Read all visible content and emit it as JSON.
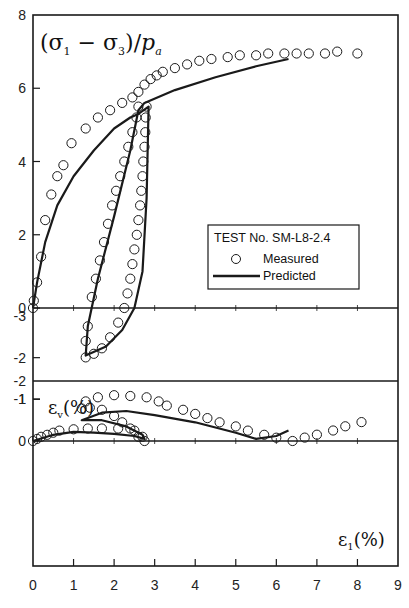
{
  "chart_data": [
    {
      "panel": "upper",
      "type": "scatter",
      "title": "",
      "ylabel": "(σ1 − σ3)/pa",
      "xlabel": "ε1(%)",
      "xlim": [
        0,
        9
      ],
      "ylim": [
        -2,
        8
      ],
      "x_ticks": [
        "0",
        "1",
        "2",
        "3",
        "4",
        "5",
        "6",
        "7",
        "8",
        "9"
      ],
      "y_ticks": [
        "8",
        "6",
        "4",
        "2",
        "0",
        "-2"
      ],
      "grid": false,
      "legend": {
        "position": "inside-center-right",
        "title": "TEST No. SM-L8-2.4",
        "entries": [
          {
            "label": "Measured",
            "marker": "open-circle"
          },
          {
            "label": "Predicted",
            "marker": "solid-line"
          }
        ]
      },
      "series": [
        {
          "name": "Measured",
          "style": "open-circle",
          "points": [
            [
              0.0,
              0.0
            ],
            [
              0.02,
              0.2
            ],
            [
              0.1,
              0.7
            ],
            [
              0.2,
              1.4
            ],
            [
              0.3,
              2.4
            ],
            [
              0.45,
              3.1
            ],
            [
              0.6,
              3.6
            ],
            [
              0.75,
              3.9
            ],
            [
              0.95,
              4.5
            ],
            [
              1.3,
              4.9
            ],
            [
              1.6,
              5.2
            ],
            [
              1.9,
              5.4
            ],
            [
              2.2,
              5.6
            ],
            [
              2.45,
              5.75
            ],
            [
              2.6,
              5.9
            ],
            [
              2.75,
              6.1
            ],
            [
              2.9,
              6.25
            ],
            [
              3.05,
              6.35
            ],
            [
              3.2,
              6.45
            ],
            [
              3.5,
              6.55
            ],
            [
              3.8,
              6.65
            ],
            [
              4.1,
              6.75
            ],
            [
              4.4,
              6.8
            ],
            [
              4.8,
              6.85
            ],
            [
              5.1,
              6.9
            ],
            [
              5.5,
              6.9
            ],
            [
              5.8,
              6.95
            ],
            [
              6.2,
              6.95
            ],
            [
              6.5,
              6.95
            ],
            [
              6.8,
              6.95
            ],
            [
              7.2,
              6.95
            ],
            [
              7.5,
              7.0
            ],
            [
              8.0,
              6.95
            ],
            [
              2.8,
              5.5
            ],
            [
              2.78,
              5.2
            ],
            [
              2.77,
              4.8
            ],
            [
              2.75,
              4.4
            ],
            [
              2.72,
              4.0
            ],
            [
              2.7,
              3.6
            ],
            [
              2.67,
              3.2
            ],
            [
              2.64,
              2.8
            ],
            [
              2.6,
              2.4
            ],
            [
              2.56,
              2.0
            ],
            [
              2.5,
              1.6
            ],
            [
              2.45,
              1.2
            ],
            [
              2.4,
              0.8
            ],
            [
              2.33,
              0.4
            ],
            [
              2.25,
              0.0
            ],
            [
              2.1,
              -0.4
            ],
            [
              1.9,
              -0.8
            ],
            [
              1.7,
              -1.1
            ],
            [
              1.5,
              -1.25
            ],
            [
              1.3,
              -1.35
            ],
            [
              1.3,
              -0.9
            ],
            [
              1.35,
              -0.5
            ],
            [
              1.45,
              0.3
            ],
            [
              1.55,
              0.8
            ],
            [
              1.65,
              1.3
            ],
            [
              1.75,
              1.8
            ],
            [
              1.85,
              2.3
            ],
            [
              1.95,
              2.8
            ],
            [
              2.05,
              3.2
            ],
            [
              2.15,
              3.6
            ],
            [
              2.25,
              4.0
            ],
            [
              2.35,
              4.4
            ],
            [
              2.45,
              4.8
            ],
            [
              2.55,
              5.2
            ],
            [
              2.6,
              5.5
            ]
          ]
        },
        {
          "name": "Predicted",
          "style": "solid-line",
          "points": [
            [
              0.0,
              0.0
            ],
            [
              0.1,
              0.7
            ],
            [
              0.3,
              1.8
            ],
            [
              0.6,
              2.8
            ],
            [
              1.0,
              3.6
            ],
            [
              1.5,
              4.3
            ],
            [
              2.0,
              4.9
            ],
            [
              2.4,
              5.2
            ],
            [
              2.6,
              5.3
            ],
            [
              2.85,
              5.5
            ],
            [
              2.85,
              5.5
            ],
            [
              2.8,
              3.0
            ],
            [
              2.7,
              1.0
            ],
            [
              2.5,
              0.0
            ],
            [
              2.2,
              -0.6
            ],
            [
              1.8,
              -1.05
            ],
            [
              1.3,
              -1.3
            ],
            [
              1.35,
              -0.5
            ],
            [
              1.6,
              0.8
            ],
            [
              2.0,
              2.5
            ],
            [
              2.4,
              4.3
            ],
            [
              2.6,
              5.4
            ],
            [
              2.75,
              5.6
            ],
            [
              3.5,
              5.95
            ],
            [
              4.5,
              6.3
            ],
            [
              5.5,
              6.6
            ],
            [
              6.3,
              6.8
            ]
          ]
        }
      ]
    },
    {
      "panel": "lower",
      "type": "scatter",
      "title": "",
      "ylabel": "εv(%)",
      "xlabel": "ε1(%)",
      "xlim": [
        0,
        9
      ],
      "ylim": [
        -3,
        1
      ],
      "x_ticks": [
        "0",
        "1",
        "2",
        "3",
        "4",
        "5",
        "6",
        "7",
        "8",
        "9"
      ],
      "y_ticks": [
        "1",
        "0",
        "-1",
        "-2",
        "-3"
      ],
      "grid": false,
      "series": [
        {
          "name": "Measured",
          "style": "open-circle",
          "points": [
            [
              0.0,
              0.0
            ],
            [
              0.1,
              -0.05
            ],
            [
              0.2,
              -0.1
            ],
            [
              0.35,
              -0.15
            ],
            [
              0.5,
              -0.2
            ],
            [
              0.65,
              -0.25
            ],
            [
              1.0,
              -0.28
            ],
            [
              1.35,
              -0.3
            ],
            [
              1.7,
              -0.3
            ],
            [
              2.1,
              -0.3
            ],
            [
              2.5,
              -0.25
            ],
            [
              2.7,
              -0.1
            ],
            [
              2.75,
              0.0
            ],
            [
              2.6,
              -0.1
            ],
            [
              2.4,
              -0.3
            ],
            [
              2.2,
              -0.45
            ],
            [
              2.0,
              -0.6
            ],
            [
              1.7,
              -0.75
            ],
            [
              1.4,
              -0.8
            ],
            [
              1.2,
              -0.78
            ],
            [
              1.3,
              -0.95
            ],
            [
              1.6,
              -1.05
            ],
            [
              2.0,
              -1.1
            ],
            [
              2.4,
              -1.08
            ],
            [
              2.8,
              -1.05
            ],
            [
              3.1,
              -0.95
            ],
            [
              3.3,
              -0.85
            ],
            [
              3.7,
              -0.75
            ],
            [
              4.0,
              -0.65
            ],
            [
              4.3,
              -0.55
            ],
            [
              4.6,
              -0.45
            ],
            [
              5.0,
              -0.35
            ],
            [
              5.3,
              -0.25
            ],
            [
              5.7,
              -0.15
            ],
            [
              6.0,
              -0.08
            ],
            [
              6.4,
              0.0
            ],
            [
              6.7,
              0.08
            ],
            [
              7.0,
              0.15
            ],
            [
              7.4,
              0.25
            ],
            [
              7.7,
              0.35
            ],
            [
              8.1,
              0.45
            ]
          ]
        },
        {
          "name": "Predicted",
          "style": "solid-line",
          "points": [
            [
              0.0,
              0.0
            ],
            [
              0.5,
              -0.15
            ],
            [
              1.0,
              -0.22
            ],
            [
              1.5,
              -0.2
            ],
            [
              2.0,
              -0.17
            ],
            [
              2.5,
              -0.12
            ],
            [
              2.75,
              -0.05
            ],
            [
              2.7,
              -0.15
            ],
            [
              2.3,
              -0.35
            ],
            [
              1.7,
              -0.5
            ],
            [
              1.2,
              -0.5
            ],
            [
              1.7,
              -0.68
            ],
            [
              2.3,
              -0.72
            ],
            [
              3.0,
              -0.62
            ],
            [
              4.0,
              -0.45
            ],
            [
              5.0,
              -0.2
            ],
            [
              5.5,
              -0.05
            ],
            [
              6.0,
              0.12
            ],
            [
              6.3,
              0.25
            ]
          ]
        }
      ]
    }
  ],
  "labels": {
    "upper_ylabel_main": "(σ",
    "upper_ylabel_sub1": "1",
    "upper_ylabel_minus": " − σ",
    "upper_ylabel_sub3": "3",
    "upper_ylabel_close": ")/",
    "upper_ylabel_p": "p",
    "upper_ylabel_a": "a",
    "lower_ylabel_eps": "ε",
    "lower_ylabel_v": "v",
    "lower_ylabel_pct": "(%)",
    "xlabel_eps": "ε",
    "xlabel_1": "1",
    "xlabel_pct": "(%)",
    "legend_title": "TEST No. SM-L8-2.4",
    "legend_measured": "Measured",
    "legend_predicted": "Predicted"
  },
  "colors": {
    "ink": "#1a1a1a",
    "background": "#ffffff"
  }
}
